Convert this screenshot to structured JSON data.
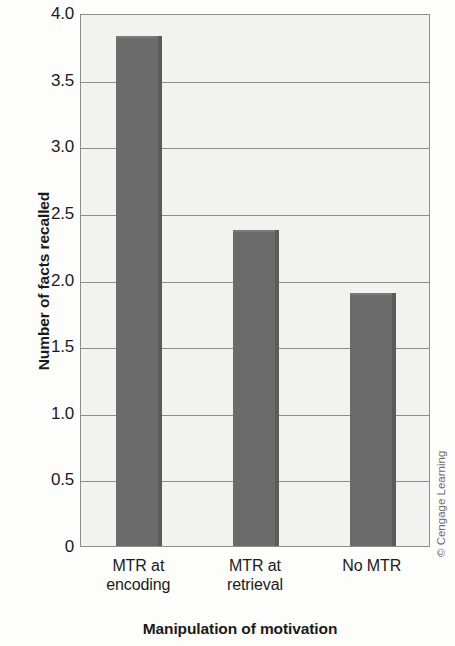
{
  "chart_data": {
    "type": "bar",
    "title": "",
    "subtitle": "",
    "categories": [
      "MTR at encoding",
      "MTR at retrieval",
      "No MTR"
    ],
    "category_lines": [
      [
        "MTR at",
        "encoding"
      ],
      [
        "MTR at",
        "retrieval"
      ],
      [
        "No MTR",
        ""
      ]
    ],
    "values": [
      3.83,
      2.37,
      1.9
    ],
    "xlabel": "Manipulation of motivation",
    "ylabel": "Number of facts recalled",
    "ylim": [
      0,
      4.0
    ],
    "yticks": [
      "4.0",
      "3.5",
      "3.0",
      "2.5",
      "2.0",
      "1.5",
      "1.0",
      "0.5",
      "0"
    ],
    "ytick_values": [
      4.0,
      3.5,
      3.0,
      2.5,
      2.0,
      1.5,
      1.0,
      0.5,
      0
    ],
    "grid": true,
    "legend": false,
    "legend_position": "none",
    "bar_color": "#6b6b6b",
    "bar_edge_color": "#5b5b5b",
    "plot_background": "#f2f2f0",
    "frame_color": "#8e8e8e",
    "gridline_color": "#8d8d8d"
  },
  "attribution": {
    "text": "© Cengage Learning"
  }
}
